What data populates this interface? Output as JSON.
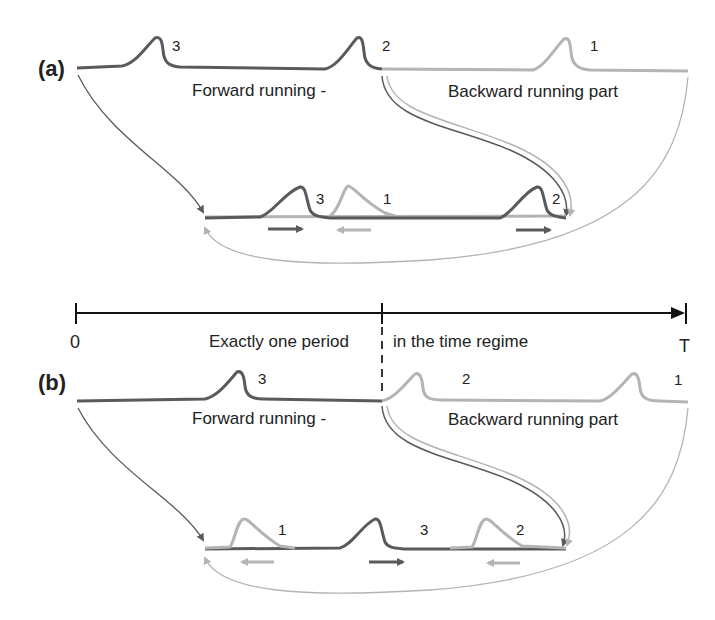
{
  "colors": {
    "forward": "#5a5a5a",
    "backward": "#b4b4b4",
    "axis": "#111111",
    "text": "#222222"
  },
  "panel_a": {
    "label": "(a)",
    "forward_text": "Forward running -",
    "backward_text": "Backward running part",
    "top_pulses": [
      "3",
      "2",
      "1"
    ],
    "bottom_pulses": [
      "3",
      "1",
      "2"
    ]
  },
  "time_axis": {
    "start": "0",
    "end": "T",
    "left_text": "Exactly one period",
    "right_text": "in the time regime"
  },
  "panel_b": {
    "label": "(b)",
    "forward_text": "Forward running -",
    "backward_text": "Backward running part",
    "top_pulses": [
      "3",
      "2",
      "1"
    ],
    "bottom_pulses": [
      "1",
      "3",
      "2"
    ]
  }
}
